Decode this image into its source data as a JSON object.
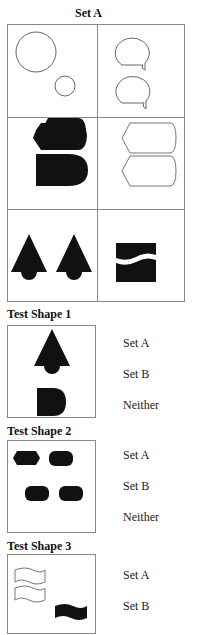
{
  "set_a": {
    "title": "Set A",
    "cells": [
      {
        "name": "two-circles-outline",
        "fill": "outline"
      },
      {
        "name": "two-speech-bubbles-outline",
        "fill": "outline"
      },
      {
        "name": "two-bullet-shapes-filled",
        "fill": "filled"
      },
      {
        "name": "two-bullet-shapes-outline",
        "fill": "outline"
      },
      {
        "name": "two-arrow-shapes-filled",
        "fill": "filled"
      },
      {
        "name": "split-square-filled",
        "fill": "filled"
      }
    ]
  },
  "tests": [
    {
      "label": "Test Shape 1",
      "options": [
        "Set A",
        "Set B",
        "Neither"
      ]
    },
    {
      "label": "Test Shape 2",
      "options": [
        "Set A",
        "Set B",
        "Neither"
      ]
    },
    {
      "label": "Test Shape 3",
      "options": [
        "Set A",
        "Set B"
      ]
    }
  ],
  "colors": {
    "border": "#888888",
    "shape_fill": "#111111"
  }
}
